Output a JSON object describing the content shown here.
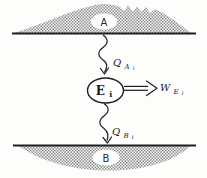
{
  "diagram": {
    "reservoir_top": {
      "label": "A"
    },
    "reservoir_bottom": {
      "label": "B"
    },
    "engine": {
      "label_main": "E",
      "label_sub": "i"
    },
    "heat_in": {
      "label_main": "Q",
      "label_sub": "A",
      "label_subsub": "i"
    },
    "heat_out": {
      "label_main": "Q",
      "label_sub": "B",
      "label_subsub": "i"
    },
    "work": {
      "label_main": "W",
      "label_sub": "E",
      "label_subsub": "i"
    },
    "colors": {
      "ink": "#1f1f1f",
      "hatch_dark": "#8f8f8f",
      "hatch_light": "#f7f7f5",
      "background": "#fdfdfc"
    }
  }
}
